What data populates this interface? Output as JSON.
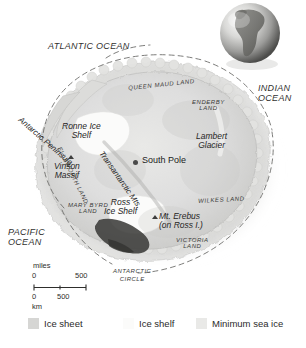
{
  "map": {
    "title": "Antarctica",
    "oceans": [
      {
        "name": "atlantic-ocean",
        "label": "ATLANTIC OCEAN"
      },
      {
        "name": "indian-ocean",
        "label": "INDIAN\nOCEAN",
        "line1": "INDIAN",
        "line2": "OCEAN"
      },
      {
        "name": "pacific-ocean",
        "label": "PACIFIC\nOCEAN",
        "line1": "PACIFIC",
        "line2": "OCEAN"
      }
    ],
    "regions": [
      {
        "name": "queen-maud-land",
        "label": "QUEEN MAUD LAND"
      },
      {
        "name": "enderby-land",
        "line1": "ENDERBY",
        "line2": "LAND"
      },
      {
        "name": "wilkes-land",
        "label": "WILKES LAND"
      },
      {
        "name": "victoria-land",
        "line1": "VICTORIA",
        "line2": "LAND"
      },
      {
        "name": "mary-byrd-land",
        "line1": "MARY BYRD",
        "line2": "LAND"
      },
      {
        "name": "ellsworth-land",
        "label": "ELLSWORTH LAND"
      }
    ],
    "features": [
      {
        "name": "antarctic-peninsula",
        "label": "Antarctic Peninsula"
      },
      {
        "name": "ronne-ice-shelf",
        "line1": "Ronne Ice",
        "line2": "Shelf"
      },
      {
        "name": "vinson-massif",
        "line1": "Vinson",
        "line2": "Massif",
        "marker": "mountain-marker"
      },
      {
        "name": "transantarctic-mts",
        "label": "Transantarctic Mts."
      },
      {
        "name": "ross-ice-shelf",
        "line1": "Ross",
        "line2": "Ice Shelf"
      },
      {
        "name": "lambert-glacier",
        "line1": "Lambert",
        "line2": "Glacier"
      },
      {
        "name": "mount-erebus",
        "line1": "Mt. Erebus",
        "line2": "(on Ross I.)",
        "marker": "mountain-marker"
      }
    ],
    "south_pole": {
      "label": "South Pole",
      "marker": "point-marker"
    },
    "antarctic_circle": {
      "line1": "ANTARCTIC",
      "line2": "CIRCLE"
    },
    "scale": {
      "miles_unit": "miles",
      "miles_min": "0",
      "miles_max": "500",
      "km_min": "0",
      "km_max": "500",
      "km_unit": "km"
    },
    "legend": [
      {
        "name": "legend-ice-sheet",
        "label": "Ice sheet",
        "color": "#d6d6d4"
      },
      {
        "name": "legend-ice-shelf",
        "label": "Ice shelf",
        "color": "#fbfbfa"
      },
      {
        "name": "legend-minimum-sea-ice",
        "label": "Minimum sea ice",
        "color": "#e9e9e7"
      }
    ],
    "inset": {
      "name": "globe-inset",
      "depicts": "south-america-globe"
    },
    "colors": {
      "background": "#ffffff",
      "ice_sheet": "#d6d6d4",
      "ice_shelf": "#fbfbfa",
      "sea_ice": "#e9e9e7",
      "shadow": "#3a3a3a",
      "text": "#2b2b2b"
    }
  }
}
